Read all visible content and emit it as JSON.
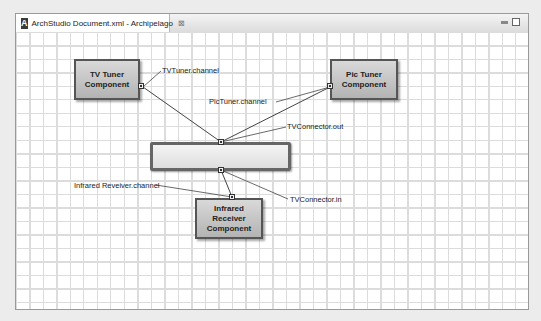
{
  "window": {
    "tab_title": "ArchStudio Document.xml - Archipelago",
    "app_icon_letter": "A",
    "tab_close_glyph": "⊠"
  },
  "diagram": {
    "components": [
      {
        "id": "tv-tuner",
        "label_line1": "TV Tuner",
        "label_line2": "Component"
      },
      {
        "id": "pic-tuner",
        "label_line1": "Pic Tuner",
        "label_line2": "Component"
      },
      {
        "id": "infrared-receiver",
        "label_line1": "Infrared Receiver",
        "label_line2": "Component"
      }
    ],
    "connector": {
      "id": "tv-connector",
      "label": ""
    },
    "interface_labels": {
      "tv_tuner_channel": "TVTuner.channel",
      "pic_tuner_channel": "PicTuner.channel",
      "tv_connector_out": "TVConnector.out",
      "tv_connector_in": "TVConnector.in",
      "infrared_channel": "Infrared Reveiver.channel"
    }
  },
  "colors": {
    "component_fill": "#c4c4c4",
    "component_border": "#555555",
    "grid": "#dcdcdc"
  }
}
